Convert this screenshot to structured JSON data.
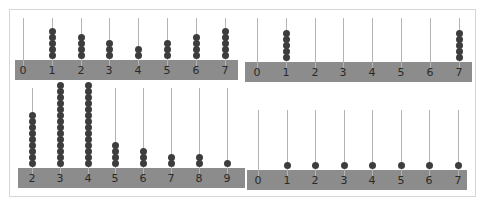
{
  "figure": {
    "colors": {
      "bar": "#8c8c8c",
      "rod": "#b4b4b4",
      "bead": "#3d3d3d",
      "frame": "#d6d6d6"
    }
  },
  "panels": [
    {
      "id": "top-left",
      "labels": [
        "0",
        "1",
        "2",
        "3",
        "4",
        "5",
        "6",
        "7"
      ],
      "counts": [
        0,
        5,
        4,
        3,
        2,
        3,
        4,
        5
      ],
      "box": {
        "left": 15,
        "top": 18,
        "barTop": 60,
        "barHeight": 20,
        "width": 223,
        "firstRod": 8,
        "spacing": 28.8,
        "rodTop": 18
      }
    },
    {
      "id": "top-right",
      "labels": [
        "0",
        "1",
        "2",
        "3",
        "4",
        "5",
        "6",
        "7"
      ],
      "counts": [
        0,
        5,
        0,
        0,
        0,
        0,
        0,
        5
      ],
      "box": {
        "left": 245,
        "top": 18,
        "barTop": 62,
        "barHeight": 20,
        "width": 227,
        "firstRod": 12,
        "spacing": 28.8,
        "rodTop": 18
      }
    },
    {
      "id": "bottom-left",
      "labels": [
        "2",
        "3",
        "4",
        "5",
        "6",
        "7",
        "8",
        "9"
      ],
      "counts": [
        9,
        14,
        14,
        4,
        3,
        2,
        2,
        1
      ],
      "box": {
        "left": 18,
        "top": 88,
        "barTop": 168,
        "barHeight": 20,
        "width": 227,
        "firstRod": 14,
        "spacing": 27.8,
        "rodTop": 88
      }
    },
    {
      "id": "bottom-right",
      "labels": [
        "0",
        "1",
        "2",
        "3",
        "4",
        "5",
        "6",
        "7"
      ],
      "counts": [
        0,
        1,
        1,
        1,
        1,
        1,
        1,
        1
      ],
      "box": {
        "left": 247,
        "top": 110,
        "barTop": 170,
        "barHeight": 20,
        "width": 220,
        "firstRod": 11,
        "spacing": 28.5,
        "rodTop": 110
      }
    }
  ]
}
